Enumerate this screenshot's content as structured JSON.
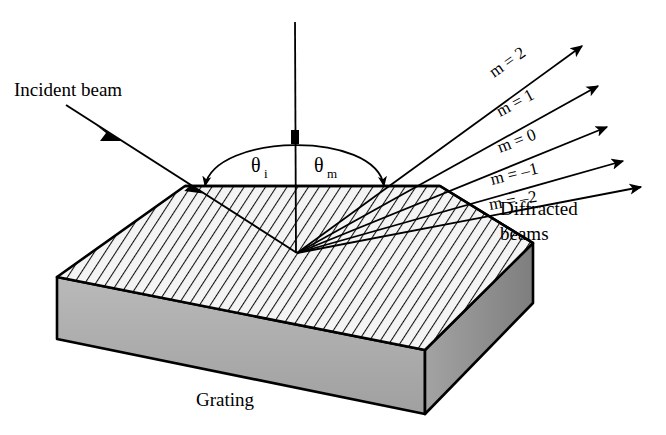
{
  "figure": {
    "title_alt": "Diffraction grating geometry",
    "background_color": "#ffffff",
    "line_color": "#000000",
    "grating_top_fill": "#f2f2f2",
    "grating_front_fill": "#a8a8a8",
    "grating_side_fill": "#8f8f8f"
  },
  "labels": {
    "incident_beam": "Incident beam",
    "diffracted_beams_line1": "Diffracted",
    "diffracted_beams_line2": "beams",
    "grating": "Grating",
    "theta_i_symbol": "θ",
    "theta_i_subscript": "i",
    "theta_m_symbol": "θ",
    "theta_m_subscript": "m"
  },
  "orders": [
    {
      "label": "m = 2",
      "m": 2,
      "angle_deg": -35.0
    },
    {
      "label": "m = 1",
      "m": 1,
      "angle_deg": -26.5
    },
    {
      "label": "m = 0",
      "m": 0,
      "angle_deg": -19.0
    },
    {
      "label": "m = –1",
      "m": -1,
      "angle_deg": -13.0
    },
    {
      "label": "m = –2",
      "m": -2,
      "angle_deg": -8.5
    }
  ],
  "icons": {
    "incident_arrow": "arrow-down-right-icon",
    "normal_line": "surface-normal-icon",
    "angle_arc": "angle-arc-icon",
    "order_arrow": "arrow-up-right-icon"
  }
}
